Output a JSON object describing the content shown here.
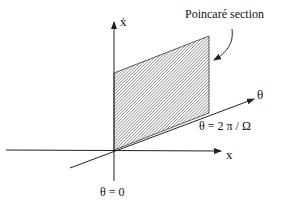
{
  "labels": {
    "vertical_axis": "ẋ",
    "horizontal_axis": "x",
    "depth_axis": "θ",
    "section_label": "Poincaré section",
    "theta_zero": "θ = 0",
    "theta_period": "θ = 2 π / Ω"
  },
  "colors": {
    "ink": "#222222",
    "hatch": "#555555",
    "background": "#ffffff"
  }
}
